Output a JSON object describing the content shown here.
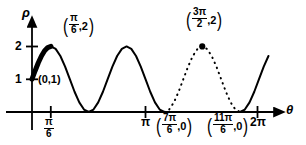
{
  "figure": {
    "title": "",
    "axes": {
      "y_axis_label": "ρ",
      "x_axis_label": "θ"
    },
    "y_ticks": [
      {
        "label": "1",
        "value": 1
      },
      {
        "label": "2",
        "value": 2
      }
    ],
    "x_ticks": [
      {
        "label_num": "π",
        "label_den": "6",
        "is_fraction": true,
        "value": "pi/6"
      },
      {
        "label_num": "π",
        "label_den": "",
        "is_fraction": false,
        "value": "pi"
      },
      {
        "label_num": "2π",
        "label_den": "",
        "is_fraction": false,
        "value": "2pi"
      }
    ],
    "annotations": [
      {
        "name": "point-label-origin",
        "text": "(0,1)",
        "kind": "plain"
      },
      {
        "name": "point-label-peak-first",
        "open": "(",
        "num": "π",
        "den": "6",
        "after": ",2",
        "close": ")",
        "kind": "fraction"
      },
      {
        "name": "point-label-peak-dotted",
        "open": "(",
        "num": "3π",
        "den": "2",
        "after": ",2",
        "close": ")",
        "kind": "fraction"
      },
      {
        "name": "zero-label-7pi6",
        "open": "(",
        "num": "7π",
        "den": "6",
        "after": ",0",
        "close": ")",
        "kind": "fraction"
      },
      {
        "name": "zero-label-11pi6",
        "open": "(",
        "num": "11π",
        "den": "6",
        "after": ",0",
        "close": ")",
        "kind": "fraction"
      }
    ],
    "colors": {
      "curve": "#000000",
      "axis": "#000000",
      "background": "#ffffff"
    }
  },
  "chart_data": {
    "type": "line",
    "title": "",
    "xlabel": "θ",
    "ylabel": "ρ",
    "xlim": [
      -0.18,
      6.9
    ],
    "ylim": [
      -0.3,
      2.45
    ],
    "grid": false,
    "legend": "none",
    "equation": "rho = 1 + sin(3*theta)",
    "x_tick_values": [
      0.5236,
      3.1416,
      6.2832
    ],
    "x_tick_labels": [
      "π/6",
      "π",
      "2π"
    ],
    "y_tick_values": [
      1,
      2
    ],
    "y_tick_labels": [
      "1",
      "2"
    ],
    "series": [
      {
        "name": "rho = 1 + sin(3theta) solid (0 to 7pi/6)",
        "style": "solid",
        "linewidth": 2,
        "x": [
          0.0,
          0.1309,
          0.2618,
          0.3927,
          0.5236,
          0.6545,
          0.7854,
          0.9163,
          1.0472,
          1.1781,
          1.309,
          1.4399,
          1.5708,
          1.7017,
          1.8326,
          1.9635,
          2.0944,
          2.2253,
          2.3562,
          2.4871,
          2.618,
          2.7489,
          2.8798,
          3.0107,
          3.1416,
          3.2725,
          3.4034,
          3.5343,
          3.6652
        ],
        "y": [
          1.0,
          1.383,
          1.707,
          1.924,
          2.0,
          1.924,
          1.707,
          1.383,
          1.0,
          0.617,
          0.293,
          0.076,
          0.0,
          0.076,
          0.293,
          0.617,
          1.0,
          1.383,
          1.707,
          1.924,
          2.0,
          1.924,
          1.707,
          1.383,
          1.0,
          0.617,
          0.293,
          0.076,
          0.0
        ]
      },
      {
        "name": "rho = 1 + sin(3theta) dotted (7pi/6 to 11pi/6)",
        "style": "dotted",
        "linewidth": 2,
        "x": [
          3.6652,
          3.7961,
          3.927,
          4.0579,
          4.1888,
          4.3197,
          4.4506,
          4.5815,
          4.7124,
          4.8433,
          4.9742,
          5.1051,
          5.236,
          5.3669,
          5.4978,
          5.6287,
          5.7596
        ],
        "y": [
          0.0,
          0.076,
          0.293,
          0.617,
          1.0,
          1.383,
          1.707,
          1.924,
          2.0,
          1.924,
          1.707,
          1.383,
          1.0,
          0.617,
          0.293,
          0.076,
          0.0
        ]
      },
      {
        "name": "rho = 1 + sin(3theta) solid tail (11pi/6 to 2pi+)",
        "style": "solid",
        "linewidth": 2,
        "x": [
          5.7596,
          5.8905,
          6.0214,
          6.1523,
          6.2832,
          6.4141,
          6.545
        ],
        "y": [
          0.0,
          0.076,
          0.293,
          0.617,
          1.0,
          1.383,
          1.707
        ]
      },
      {
        "name": "bold highlighted arc (0 to pi/6)",
        "style": "solid-bold",
        "linewidth": 5,
        "x": [
          0.0,
          0.0873,
          0.1745,
          0.2618,
          0.3491,
          0.4363,
          0.5236
        ],
        "y": [
          1.0,
          1.259,
          1.5,
          1.707,
          1.866,
          1.966,
          2.0
        ]
      }
    ],
    "points": [
      {
        "label": "(π/6, 2)",
        "x": 0.5236,
        "y": 2,
        "marker": "none"
      },
      {
        "label": "(0, 1)",
        "x": 0.0,
        "y": 1,
        "marker": "none"
      },
      {
        "label": "(3π/2, 2)",
        "x": 4.7124,
        "y": 2,
        "marker": "filled-dot"
      },
      {
        "label": "(7π/6, 0)",
        "x": 3.6652,
        "y": 0,
        "marker": "none"
      },
      {
        "label": "(11π/6, 0)",
        "x": 5.7596,
        "y": 0,
        "marker": "none"
      }
    ]
  }
}
